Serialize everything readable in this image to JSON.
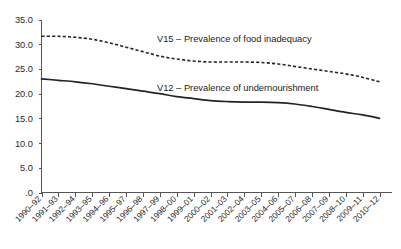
{
  "chart_data": {
    "type": "line",
    "title": "",
    "subtitle": "",
    "xlabel": "",
    "ylabel": "",
    "grid": false,
    "legend_position": "inline-annotation",
    "ylim": [
      0.0,
      35.0
    ],
    "y_ticks": [
      "35.0",
      "30.0",
      "25.0",
      "20.0",
      "15.0",
      "10.0",
      "5.0",
      ".0"
    ],
    "y_tick_values": [
      35.0,
      30.0,
      25.0,
      20.0,
      15.0,
      10.0,
      5.0,
      0.0
    ],
    "categories": [
      "1990–92",
      "1991–93",
      "1992–94",
      "1993–95",
      "1994–96",
      "1995–97",
      "1996–98",
      "1997–99",
      "1998–00",
      "1999–01",
      "2000–02",
      "2001–03",
      "2002–04",
      "2003–05",
      "2004–06",
      "2005–07",
      "2006–08",
      "2007–09",
      "2008–10",
      "2009–11",
      "2010–12"
    ],
    "series": [
      {
        "name": "V15 – Prevalence of food inadequacy",
        "style": "dashed",
        "color": "#242424",
        "values": [
          31.6,
          31.6,
          31.4,
          31.0,
          30.3,
          29.4,
          28.5,
          27.6,
          27.0,
          26.6,
          26.4,
          26.4,
          26.4,
          26.3,
          26.0,
          25.5,
          25.0,
          24.5,
          24.0,
          23.3,
          22.4
        ]
      },
      {
        "name": "V12 – Prevalence of undernourishment",
        "style": "solid",
        "color": "#242424",
        "values": [
          23.0,
          22.7,
          22.4,
          22.0,
          21.5,
          21.0,
          20.5,
          20.0,
          19.4,
          19.0,
          18.6,
          18.4,
          18.3,
          18.3,
          18.2,
          17.9,
          17.4,
          16.8,
          16.2,
          15.7,
          15.0
        ]
      }
    ],
    "annotations": [
      {
        "id": "v15-label",
        "text": "V15 – Prevalence of food inadequacy",
        "x_px": 157,
        "y_px": 42
      },
      {
        "id": "v12-label",
        "text": "V12 – Prevalence of undernourishment",
        "x_px": 157,
        "y_px": 91
      }
    ]
  }
}
